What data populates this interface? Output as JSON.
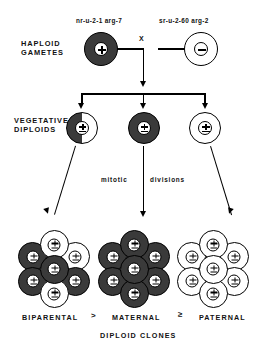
{
  "figure": {
    "title_caption": "DIPLOID CLONES",
    "row_labels": {
      "haploid": "HAPLOID\nGAMETES",
      "haploid_line1": "HAPLOID",
      "haploid_line2": "GAMETES",
      "vegetative_line1": "VEGETATIVE",
      "vegetative_line2": "DIPLOIDS"
    },
    "cross_symbol": "X",
    "mitotic_label_left": "mitotic",
    "mitotic_label_right": "divisions",
    "gametes": [
      {
        "genotype": "nr-u-2-1 arg-7",
        "mating_type": "+",
        "shading": "dark",
        "name": "maternal-gamete"
      },
      {
        "genotype": "sr-u-2-60 arg-2",
        "mating_type": "−",
        "shading": "light",
        "name": "paternal-gamete"
      }
    ],
    "diploids": [
      {
        "shading": "half",
        "nucleus": "±",
        "name": "biparental-diploid"
      },
      {
        "shading": "dark",
        "nucleus": "±",
        "name": "maternal-diploid"
      },
      {
        "shading": "light",
        "nucleus": "±",
        "name": "paternal-diploid"
      }
    ],
    "clones": [
      {
        "label": "BIPARENTAL",
        "name": "biparental-clone",
        "cells": [
          "light",
          "dark",
          "light",
          "dark",
          "dark",
          "dark",
          "light"
        ]
      },
      {
        "label": "MATERNAL",
        "name": "maternal-clone",
        "cells": [
          "dark",
          "dark",
          "dark",
          "dark",
          "dark",
          "dark",
          "dark"
        ]
      },
      {
        "label": "PATERNAL",
        "name": "paternal-clone",
        "cells": [
          "light",
          "light",
          "light",
          "light",
          "light",
          "light",
          "light"
        ]
      }
    ],
    "operators": [
      ">",
      "≥"
    ],
    "colors": {
      "dark_cell": "#3a3a3a",
      "light_cell": "#ffffff",
      "outline": "#000000",
      "background": "#ffffff"
    }
  }
}
